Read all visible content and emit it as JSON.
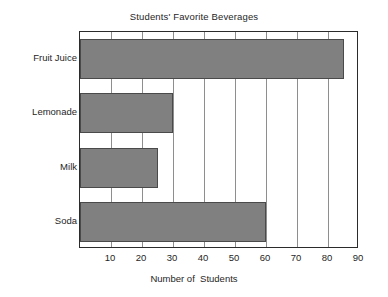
{
  "chart_data": {
    "type": "bar",
    "orientation": "horizontal",
    "title": "Students' Favorite Beverages",
    "xlabel": "Number of  Students",
    "ylabel": "",
    "categories": [
      "Fruit Juice",
      "Lemonade",
      "Milk",
      "Soda"
    ],
    "values": [
      85,
      30,
      25,
      60
    ],
    "xlim": [
      0,
      90
    ],
    "xticks": [
      10,
      20,
      30,
      40,
      50,
      60,
      70,
      80,
      90
    ],
    "xtick_labels": [
      "10",
      "20",
      "30",
      "40",
      "50",
      "60",
      "70",
      "80",
      "90"
    ],
    "grid": true,
    "grid_axis": "x",
    "legend": false,
    "bar_color": "#808080",
    "bar_border_color": "#4a4a4a",
    "axis_color": "#2b2b2b",
    "grid_color": "#8e8e8e",
    "background": "#ffffff"
  }
}
